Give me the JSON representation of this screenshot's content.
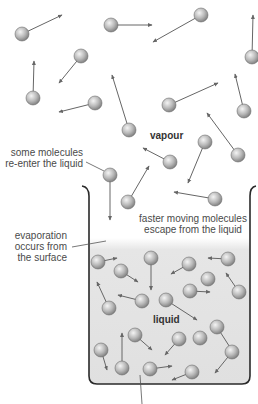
{
  "labels": {
    "vapour": "vapour",
    "liquid": "liquid",
    "reenter_line1": "some molecules",
    "reenter_line2": "re-enter the liquid",
    "escape_line1": "faster moving molecules",
    "escape_line2": "escape from the liquid",
    "evap_line1": "evaporation",
    "evap_line2": "occurs from",
    "evap_line3": "the surface"
  },
  "colors": {
    "molecule_fill": "#b8b8b8",
    "arrow": "#666666",
    "beaker_outline": "#2a2a2a",
    "liquid_fill": "#e4e4e4",
    "text": "#4a4a4a"
  },
  "vapour_molecules": [
    {
      "cx": 22,
      "cy": 34,
      "ax": 62,
      "ay": 15
    },
    {
      "cx": 111,
      "cy": 25,
      "ax": 152,
      "ay": 25
    },
    {
      "cx": 201,
      "cy": 15,
      "ax": 153,
      "ay": 42
    },
    {
      "cx": 252,
      "cy": 57,
      "ax": 253,
      "ay": 15
    },
    {
      "cx": 81,
      "cy": 56,
      "ax": 59,
      "ay": 83
    },
    {
      "cx": 33,
      "cy": 98,
      "ax": 34,
      "ay": 61
    },
    {
      "cx": 95,
      "cy": 103,
      "ax": 59,
      "ay": 112
    },
    {
      "cx": 129,
      "cy": 130,
      "ax": 112,
      "ay": 75
    },
    {
      "cx": 169,
      "cy": 105,
      "ax": 218,
      "ay": 83
    },
    {
      "cx": 244,
      "cy": 111,
      "ax": 235,
      "ay": 74
    },
    {
      "cx": 238,
      "cy": 155,
      "ax": 207,
      "ay": 113
    },
    {
      "cx": 205,
      "cy": 142,
      "ax": 188,
      "ay": 183
    },
    {
      "cx": 170,
      "cy": 162,
      "ax": 143,
      "ay": 148
    },
    {
      "cx": 215,
      "cy": 199,
      "ax": 174,
      "ay": 192
    },
    {
      "cx": 128,
      "cy": 202,
      "ax": 149,
      "ay": 166
    },
    {
      "cx": 110,
      "cy": 175,
      "ax": 110,
      "ay": 220
    }
  ],
  "liquid_molecules": [
    {
      "cx": 98,
      "cy": 262,
      "ax": 117,
      "ay": 258
    },
    {
      "cx": 121,
      "cy": 271,
      "ax": 138,
      "ay": 282
    },
    {
      "cx": 151,
      "cy": 258,
      "ax": 151,
      "ay": 290
    },
    {
      "cx": 189,
      "cy": 264,
      "ax": 171,
      "ay": 274
    },
    {
      "cx": 228,
      "cy": 259,
      "ax": 208,
      "ay": 258
    },
    {
      "cx": 208,
      "cy": 279,
      "ax": null,
      "ay": null
    },
    {
      "cx": 190,
      "cy": 291,
      "ax": 210,
      "ay": 292
    },
    {
      "cx": 239,
      "cy": 292,
      "ax": 226,
      "ay": 273
    },
    {
      "cx": 109,
      "cy": 308,
      "ax": 97,
      "ay": 282
    },
    {
      "cx": 142,
      "cy": 301,
      "ax": 118,
      "ay": 295
    },
    {
      "cx": 166,
      "cy": 300,
      "ax": 197,
      "ay": 320
    },
    {
      "cx": 217,
      "cy": 327,
      "ax": 233,
      "ay": 352
    },
    {
      "cx": 135,
      "cy": 335,
      "ax": 152,
      "ay": 350
    },
    {
      "cx": 179,
      "cy": 339,
      "ax": 165,
      "ay": 355
    },
    {
      "cx": 200,
      "cy": 338,
      "ax": null,
      "ay": null
    },
    {
      "cx": 101,
      "cy": 350,
      "ax": 107,
      "ay": 370
    },
    {
      "cx": 122,
      "cy": 368,
      "ax": 122,
      "ay": 333
    },
    {
      "cx": 150,
      "cy": 369,
      "ax": 172,
      "ay": 366
    },
    {
      "cx": 232,
      "cy": 352,
      "ax": 215,
      "ay": 373
    },
    {
      "cx": 192,
      "cy": 372,
      "ax": 172,
      "ay": 380
    }
  ]
}
